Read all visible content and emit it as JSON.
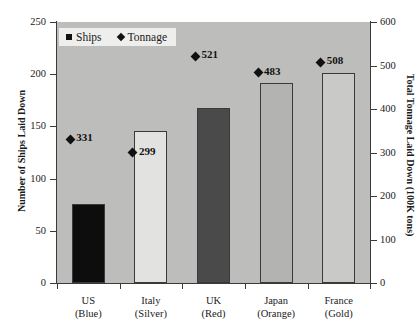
{
  "chart_data": {
    "type": "bar",
    "title": "",
    "subtitle": "",
    "categories": [
      "US",
      "Italy",
      "UK",
      "Japan",
      "France"
    ],
    "category_sublabels": [
      "(Blue)",
      "(Silver)",
      "(Red)",
      "(Orange)",
      "(Gold)"
    ],
    "series": [
      {
        "name": "Ships",
        "marker": "square",
        "axis": "left",
        "values": [
          76,
          146,
          168,
          192,
          201
        ],
        "bar_colors": [
          "#0d0d0d",
          "#e2e2e0",
          "#4a4a4a",
          "#b3b3b1",
          "#c9c9c7"
        ]
      },
      {
        "name": "Tonnage",
        "marker": "diamond",
        "axis": "right",
        "values": [
          331,
          299,
          521,
          483,
          508
        ],
        "labels": [
          "331",
          "299",
          "521",
          "483",
          "508"
        ]
      }
    ],
    "xlabel": "",
    "ylabel": "Number of Ships Laid Down",
    "ylabel_right": "Total Tonnage Laid Down (100K tons)",
    "ylim": [
      0,
      250
    ],
    "ylim_right": [
      0,
      600
    ],
    "yticks": [
      "0",
      "50",
      "100",
      "150",
      "200",
      "250"
    ],
    "yticks_right": [
      "0",
      "100",
      "200",
      "300",
      "400",
      "500",
      "600"
    ],
    "grid": false,
    "legend_position": "top-left",
    "plot_background": "#bdbdbb",
    "axis_color": "#3a3a3a",
    "marker_color": "#111111"
  },
  "legend": {
    "items": [
      {
        "label": "Ships",
        "marker": "square"
      },
      {
        "label": "Tonnage",
        "marker": "diamond"
      }
    ]
  }
}
